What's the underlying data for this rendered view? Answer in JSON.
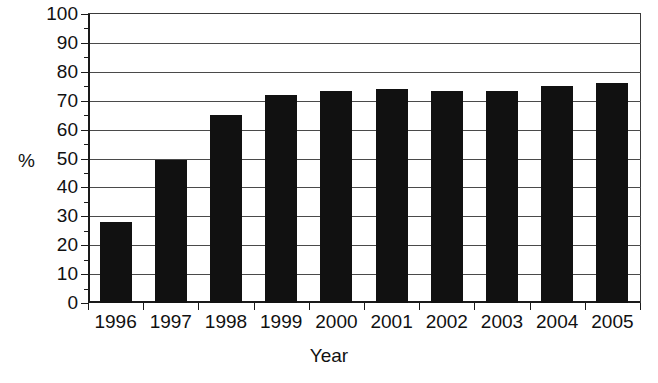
{
  "chart_data": {
    "type": "bar",
    "title": "",
    "xlabel": "Year",
    "ylabel": "%",
    "categories": [
      "1996",
      "1997",
      "1998",
      "1999",
      "2000",
      "2001",
      "2002",
      "2003",
      "2004",
      "2005"
    ],
    "values": [
      28,
      49.5,
      65,
      72,
      73.5,
      74,
      73.5,
      73.5,
      75,
      76
    ],
    "ylim": [
      0,
      100
    ],
    "yticks": [
      0,
      10,
      20,
      30,
      40,
      50,
      60,
      70,
      80,
      90,
      100
    ],
    "ytick_labels": [
      "0",
      "10",
      "20",
      "30",
      "40",
      "50",
      "60",
      "70",
      "80",
      "90",
      "100"
    ],
    "grid": true,
    "grid_axis": "y",
    "legend": false,
    "legend_position": "none",
    "bar_color": "#111111",
    "axis_color": "#1a1a1a",
    "grid_color": "#4a4a4a",
    "background": "#ffffff"
  }
}
